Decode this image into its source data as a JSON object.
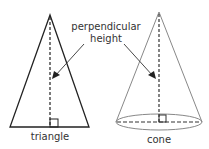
{
  "labels": {
    "perpendicular": "perpendicular",
    "height": "height",
    "triangle": "triangle",
    "cone": "cone"
  },
  "colors": {
    "triangle_stroke": "#222222",
    "cone_stroke": "#888888",
    "text": "#333333"
  }
}
